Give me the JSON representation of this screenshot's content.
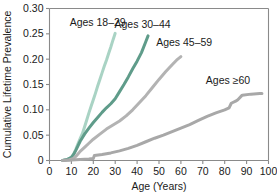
{
  "chart_data": {
    "type": "line",
    "title": "",
    "xlabel": "Age (Years)",
    "ylabel": "Cumulative Lifetime Prevalence",
    "xlim": [
      0,
      100
    ],
    "ylim": [
      0,
      0.3
    ],
    "xticks": [
      "0",
      "10",
      "20",
      "30",
      "40",
      "50",
      "60",
      "70",
      "80",
      "90",
      "100"
    ],
    "yticks": [
      "0",
      "0.05",
      "0.10",
      "0.15",
      "0.20",
      "0.25",
      "0.30"
    ],
    "grid": false,
    "legend_position": "inline-annotations",
    "series": [
      {
        "name": "Ages 18–29",
        "color": "#a9d3c4",
        "label": "Ages 18–29",
        "label_x": 22.0,
        "label_y": 0.273,
        "x": [
          6,
          8,
          10,
          11,
          12,
          13,
          14,
          15,
          16,
          17,
          18,
          19,
          20,
          21,
          22,
          23,
          24,
          25,
          26,
          27,
          28,
          29,
          30
        ],
        "y": [
          0.0,
          0.002,
          0.006,
          0.012,
          0.022,
          0.033,
          0.043,
          0.053,
          0.066,
          0.08,
          0.094,
          0.107,
          0.12,
          0.133,
          0.147,
          0.16,
          0.173,
          0.186,
          0.198,
          0.211,
          0.224,
          0.238,
          0.251
        ]
      },
      {
        "name": "Ages 30–44",
        "color": "#5f9c8a",
        "label": "Ages 30–44",
        "label_x": 42.5,
        "label_y": 0.268,
        "x": [
          6,
          8,
          10,
          11,
          12,
          13,
          14,
          15,
          16,
          18,
          20,
          22,
          24,
          26,
          28,
          30,
          32,
          34,
          36,
          38,
          40,
          42,
          44,
          45
        ],
        "y": [
          0.0,
          0.002,
          0.006,
          0.012,
          0.02,
          0.029,
          0.038,
          0.045,
          0.052,
          0.064,
          0.075,
          0.085,
          0.095,
          0.104,
          0.112,
          0.122,
          0.136,
          0.15,
          0.165,
          0.181,
          0.196,
          0.213,
          0.235,
          0.246
        ]
      },
      {
        "name": "Ages 45–59",
        "color": "#b3b3b3",
        "label": "Ages 45–59",
        "label_x": 61.5,
        "label_y": 0.232,
        "x": [
          6,
          9,
          11,
          12,
          13,
          14,
          16,
          18,
          20,
          23,
          26,
          29,
          32,
          35,
          38,
          41,
          44,
          47,
          50,
          53,
          56,
          58,
          60
        ],
        "y": [
          0.0,
          0.001,
          0.004,
          0.008,
          0.013,
          0.018,
          0.026,
          0.034,
          0.042,
          0.052,
          0.062,
          0.07,
          0.078,
          0.088,
          0.1,
          0.114,
          0.128,
          0.144,
          0.16,
          0.175,
          0.189,
          0.198,
          0.205
        ]
      },
      {
        "name": "Ages ≥60",
        "color": "#a8a8a8",
        "label": "Ages ≥60",
        "label_x": 81.5,
        "label_y": 0.158,
        "x": [
          6,
          10,
          14,
          18,
          20,
          20.5,
          24,
          28,
          32,
          36,
          40,
          44,
          48,
          52,
          56,
          60,
          64,
          68,
          72,
          76,
          80,
          82,
          83,
          85,
          86,
          88,
          92,
          96,
          97
        ],
        "y": [
          0.0,
          0.001,
          0.002,
          0.003,
          0.004,
          0.01,
          0.012,
          0.015,
          0.019,
          0.024,
          0.03,
          0.037,
          0.044,
          0.05,
          0.057,
          0.064,
          0.071,
          0.079,
          0.087,
          0.094,
          0.1,
          0.104,
          0.113,
          0.117,
          0.12,
          0.129,
          0.131,
          0.132,
          0.132
        ]
      }
    ]
  }
}
